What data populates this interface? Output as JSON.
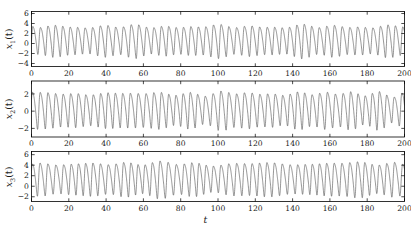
{
  "figure": {
    "width": 411,
    "height": 229,
    "background": "#ffffff",
    "line_color": "#555555",
    "frame_color": "#000000"
  },
  "axis_label_x": "t",
  "panels": [
    {
      "id": "panel-1",
      "ylabel_base": "x",
      "ylabel_sub": "1",
      "ylabel_suffix": "(t)",
      "yticks": [
        6,
        4,
        2,
        0,
        -2,
        -4
      ],
      "ytick_labels": [
        "6",
        "4",
        "2",
        "0",
        "−2",
        "−4"
      ],
      "ylim": [
        -4.6,
        6.4
      ],
      "xticks": [
        0,
        20,
        40,
        60,
        80,
        100,
        120,
        140,
        160,
        180,
        200
      ],
      "xtick_labels": [
        "0",
        "20",
        "40",
        "60",
        "80",
        "100",
        "120",
        "140",
        "160",
        "180",
        "200"
      ],
      "xlim": [
        0,
        200
      ],
      "show_xtick_labels": true
    },
    {
      "id": "panel-2",
      "ylabel_base": "x",
      "ylabel_sub": "2",
      "ylabel_suffix": "(t)",
      "yticks": [
        2,
        0,
        -2
      ],
      "ytick_labels": [
        "2",
        "0",
        "−2"
      ],
      "ylim": [
        -3.0,
        3.5
      ],
      "xticks": [
        0,
        20,
        40,
        60,
        80,
        100,
        120,
        140,
        160,
        180,
        200
      ],
      "xtick_labels": [
        "0",
        "20",
        "40",
        "60",
        "80",
        "100",
        "120",
        "140",
        "160",
        "180",
        "200"
      ],
      "xlim": [
        0,
        200
      ],
      "show_xtick_labels": true
    },
    {
      "id": "panel-3",
      "ylabel_base": "x",
      "ylabel_sub": "3",
      "ylabel_suffix": "(t)",
      "yticks": [
        6,
        4,
        2,
        0,
        -2
      ],
      "ytick_labels": [
        "6",
        "4",
        "2",
        "0",
        "−2"
      ],
      "ylim": [
        -2.9,
        6.6
      ],
      "xticks": [
        0,
        20,
        40,
        60,
        80,
        100,
        120,
        140,
        160,
        180,
        200
      ],
      "xtick_labels": [
        "0",
        "20",
        "40",
        "60",
        "80",
        "100",
        "120",
        "140",
        "160",
        "180",
        "200"
      ],
      "xlim": [
        0,
        200
      ],
      "show_xtick_labels": true
    }
  ],
  "chart_data": {
    "type": "line",
    "title": "",
    "xlabel": "t",
    "x_range": [
      0,
      200
    ],
    "n_points": 3000,
    "series": [
      {
        "name": "x1(t)",
        "ylabel": "x1(t)",
        "ylim": [
          -4.6,
          6.4
        ],
        "base_period": 4.05,
        "mean": 0.9,
        "amp_mean": 3.1,
        "peak_typical": 4.6,
        "trough_typical": -2.5,
        "peak_max": 5.4,
        "trough_min": -3.6,
        "yticks": [
          6,
          4,
          2,
          0,
          -2,
          -4
        ]
      },
      {
        "name": "x2(t)",
        "ylabel": "x2(t)",
        "ylim": [
          -3.0,
          3.5
        ],
        "base_period": 4.05,
        "mean": 0.35,
        "amp_mean": 2.1,
        "peak_typical": 2.7,
        "trough_typical": -1.8,
        "peak_max": 3.2,
        "trough_min": -2.4,
        "yticks": [
          2,
          0,
          -2
        ]
      },
      {
        "name": "x3(t)",
        "ylabel": "x3(t)",
        "ylim": [
          -2.9,
          6.6
        ],
        "base_period": 4.05,
        "mean": 1.7,
        "amp_mean": 3.2,
        "peak_typical": 5.1,
        "trough_typical": -1.6,
        "peak_max": 6.2,
        "trough_min": -2.5,
        "yticks": [
          6,
          4,
          2,
          0,
          -2
        ]
      }
    ],
    "xticks": [
      0,
      20,
      40,
      60,
      80,
      100,
      120,
      140,
      160,
      180,
      200
    ],
    "grid": false,
    "legend": "none"
  }
}
